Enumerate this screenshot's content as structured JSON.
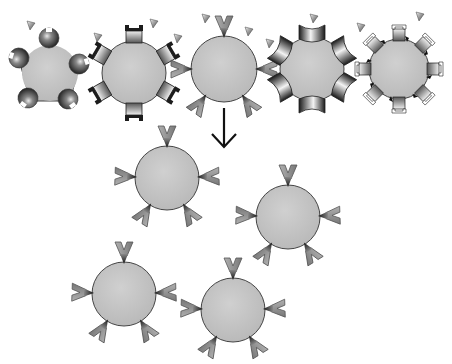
{
  "diagram": {
    "colors": {
      "core_fill": "#c4c4c4",
      "core_stroke": "#555555",
      "receptor_dark": "#2a2a2a",
      "receptor_mid": "#7a7a7a",
      "receptor_light": "#d8d8d8",
      "ligand_fill": "#9a9a9a",
      "arrow": "#111111",
      "background": "#ffffff"
    },
    "top_row": [
      {
        "id": "particle-1",
        "receptor_type": "spherical-cup",
        "receptor_count": 5,
        "cx": 50,
        "cy": 73,
        "r": 32
      },
      {
        "id": "particle-2",
        "receptor_type": "castellated-block",
        "receptor_count": 6,
        "cx": 134,
        "cy": 73,
        "r": 32
      },
      {
        "id": "particle-3",
        "receptor_type": "v-notch-ligand-bound",
        "receptor_count": 5,
        "cx": 224,
        "cy": 69,
        "r": 33
      },
      {
        "id": "particle-4",
        "receptor_type": "curved-concave",
        "receptor_count": 6,
        "cx": 312,
        "cy": 69,
        "r": 32
      },
      {
        "id": "particle-5",
        "receptor_type": "hook-block",
        "receptor_count": 8,
        "cx": 399,
        "cy": 69,
        "r": 30
      }
    ],
    "free_ligands": [
      {
        "x": 31,
        "y": 25
      },
      {
        "x": 98,
        "y": 37
      },
      {
        "x": 154,
        "y": 23
      },
      {
        "x": 178,
        "y": 38
      },
      {
        "x": 206,
        "y": 18
      },
      {
        "x": 249,
        "y": 31
      },
      {
        "x": 270,
        "y": 43
      },
      {
        "x": 314,
        "y": 18
      },
      {
        "x": 361,
        "y": 27
      },
      {
        "x": 420,
        "y": 16
      }
    ],
    "selection_arrow": {
      "x": 224,
      "y1": 108,
      "y2": 148
    },
    "selected_copies": [
      {
        "id": "copy-1",
        "cx": 167,
        "cy": 178,
        "r": 32
      },
      {
        "id": "copy-2",
        "cx": 288,
        "cy": 217,
        "r": 32
      },
      {
        "id": "copy-3",
        "cx": 124,
        "cy": 294,
        "r": 32
      },
      {
        "id": "copy-4",
        "cx": 233,
        "cy": 310,
        "r": 32
      }
    ]
  }
}
